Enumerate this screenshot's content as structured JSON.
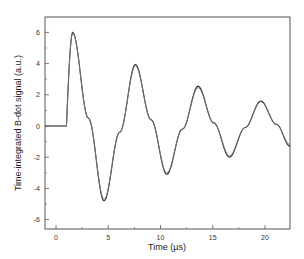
{
  "chart_data": {
    "type": "line",
    "title": "",
    "xlabel": "Time (µs)",
    "ylabel": "Time-integrated B-dot signal (a.u.)",
    "xlim": [
      -1.0,
      22.4
    ],
    "ylim": [
      -6.2,
      7.0
    ],
    "xticks": [
      0,
      5,
      10,
      15,
      20
    ],
    "yticks": [
      -6,
      -4,
      -2,
      0,
      2,
      4,
      6
    ],
    "grid": false,
    "legend": null,
    "colors": {
      "series1": "#2a2a2a",
      "series2": "#7a7a7a",
      "frame": "#555555"
    },
    "series": [
      {
        "name": "signal-1",
        "x": [
          0,
          1.0,
          1.6,
          3.1,
          4.6,
          6.1,
          7.6,
          9.1,
          10.6,
          12.1,
          13.6,
          15.1,
          16.6,
          18.1,
          19.6,
          21.1,
          22.4
        ],
        "y": [
          0,
          0,
          6.0,
          0.5,
          -4.8,
          -0.4,
          3.95,
          0.4,
          -3.1,
          -0.2,
          2.55,
          0.2,
          -2.0,
          -0.1,
          1.6,
          0.1,
          -1.3
        ]
      },
      {
        "name": "signal-2",
        "x": [
          0,
          1.0,
          1.6,
          3.1,
          4.6,
          6.1,
          7.6,
          9.1,
          10.6,
          12.1,
          13.6,
          15.1,
          16.6,
          18.1,
          19.6,
          21.1,
          22.4
        ],
        "y": [
          0,
          0,
          5.95,
          0.5,
          -4.7,
          -0.4,
          3.85,
          0.4,
          -3.0,
          -0.2,
          2.45,
          0.2,
          -1.9,
          -0.1,
          1.55,
          0.1,
          -1.2
        ]
      }
    ]
  },
  "axes": {
    "xlabel": "Time (µs)",
    "ylabel": "Time-integrated B-dot signal (a.u.)",
    "xtick_labels": [
      "0",
      "5",
      "10",
      "15",
      "20"
    ],
    "ytick_labels": [
      "-6",
      "-4",
      "-2",
      "0",
      "2",
      "4",
      "6"
    ]
  }
}
